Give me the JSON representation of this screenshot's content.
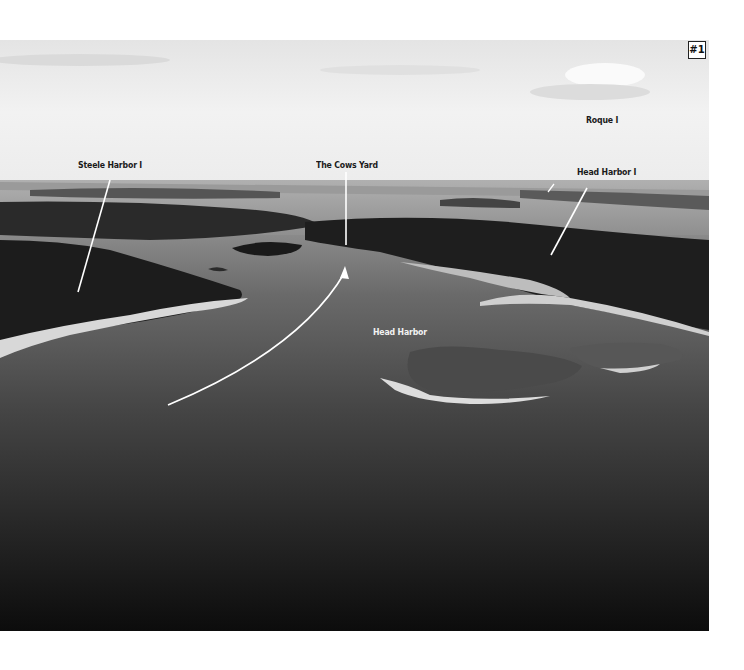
{
  "figure": {
    "badge": "#1",
    "labels": {
      "steele_harbor": "Steele Harbor I",
      "cows_yard": "The Cows Yard",
      "roque": "Roque I",
      "head_harbor_island": "Head Harbor I",
      "head_harbor": "Head Harbor"
    },
    "colors": {
      "sky": "#e9e9e9",
      "water": "#3a3a3a",
      "forest": "#1e1e1e",
      "annotation_line": "#ffffff"
    }
  }
}
